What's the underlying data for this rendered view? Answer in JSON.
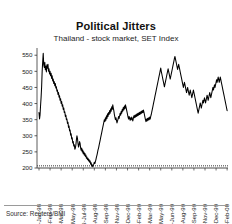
{
  "chart_data": {
    "type": "line",
    "title": "Political Jitters",
    "subtitle": "Thailand - stock market, SET Index",
    "xlabel": "",
    "ylabel": "",
    "ylim": [
      200,
      560
    ],
    "yticks": [
      200,
      250,
      300,
      350,
      400,
      450,
      500,
      550
    ],
    "grid": false,
    "legend": null,
    "line_color": "#000000",
    "source": "Source: Reuters/BMI",
    "xtick_labels": [
      "05-Jan-98",
      "17-Feb-98",
      "31-Mar-98",
      "21-May-98",
      "03-Jul-98",
      "18-Aug-98",
      "29-Sep-98",
      "11-Nov-98",
      "25-Dec-98",
      "09-Feb-99",
      "24-Mar-99",
      "13-May-99",
      "25-Jun-99",
      "09-Aug-99",
      "21-Sep-99",
      "03-Nov-99",
      "17-Dec-99",
      "01-Feb-00"
    ],
    "series": [
      {
        "name": "SET Index",
        "values": [
          372,
          352,
          365,
          395,
          420,
          452,
          500,
          530,
          556,
          520,
          512,
          528,
          505,
          516,
          498,
          520,
          510,
          522,
          500,
          508,
          492,
          500,
          486,
          494,
          478,
          486,
          470,
          476,
          462,
          468,
          455,
          462,
          448,
          452,
          438,
          442,
          428,
          434,
          420,
          424,
          410,
          415,
          400,
          406,
          392,
          396,
          382,
          386,
          372,
          374,
          360,
          364,
          350,
          352,
          338,
          342,
          326,
          330,
          315,
          318,
          302,
          306,
          290,
          294,
          278,
          282,
          268,
          272,
          258,
          262,
          272,
          288,
          300,
          292,
          276,
          265,
          272,
          282,
          276,
          262,
          255,
          262,
          250,
          256,
          244,
          250,
          240,
          246,
          236,
          240,
          230,
          234,
          226,
          230,
          222,
          226,
          218,
          222,
          212,
          216,
          206,
          210,
          204,
          208,
          212,
          218,
          214,
          220,
          226,
          234,
          240,
          248,
          256,
          262,
          270,
          278,
          286,
          294,
          302,
          310,
          318,
          326,
          334,
          342,
          350,
          344,
          356,
          348,
          362,
          354,
          368,
          360,
          372,
          366,
          378,
          370,
          384,
          376,
          390,
          382,
          396,
          386,
          378,
          366,
          358,
          350,
          356,
          348,
          340,
          346,
          352,
          360,
          354,
          362,
          370,
          364,
          376,
          370,
          382,
          376,
          388,
          380,
          392,
          384,
          396,
          390,
          382,
          374,
          366,
          358,
          352,
          360,
          354,
          348,
          356,
          350,
          358,
          352,
          346,
          354,
          362,
          356,
          364,
          358,
          366,
          360,
          368,
          362,
          370,
          364,
          372,
          366,
          374,
          368,
          376,
          370,
          378,
          372,
          380,
          374,
          366,
          358,
          350,
          344,
          352,
          346,
          354,
          348,
          356,
          350,
          358,
          352,
          360,
          366,
          374,
          382,
          390,
          398,
          406,
          414,
          422,
          430,
          438,
          446,
          454,
          462,
          470,
          478,
          486,
          494,
          502,
          510,
          500,
          492,
          484,
          476,
          468,
          460,
          452,
          460,
          468,
          476,
          484,
          492,
          500,
          508,
          500,
          492,
          484,
          476,
          484,
          492,
          500,
          508,
          516,
          524,
          532,
          540,
          546,
          538,
          530,
          522,
          514,
          506,
          514,
          522,
          514,
          506,
          498,
          490,
          482,
          474,
          466,
          458,
          450,
          458,
          466,
          458,
          450,
          442,
          434,
          442,
          450,
          442,
          434,
          426,
          434,
          442,
          434,
          426,
          418,
          426,
          434,
          442,
          434,
          426,
          418,
          410,
          402,
          394,
          386,
          378,
          370,
          378,
          386,
          394,
          402,
          394,
          386,
          394,
          402,
          410,
          402,
          410,
          418,
          410,
          402,
          410,
          418,
          426,
          418,
          410,
          418,
          426,
          434,
          426,
          418,
          426,
          434,
          442,
          450,
          442,
          450,
          458,
          450,
          458,
          466,
          474,
          466,
          474,
          482,
          474,
          466,
          474,
          482,
          474,
          466,
          458,
          450,
          442,
          434,
          426,
          418,
          410,
          402,
          394,
          386,
          378
        ]
      }
    ],
    "annotations": []
  }
}
